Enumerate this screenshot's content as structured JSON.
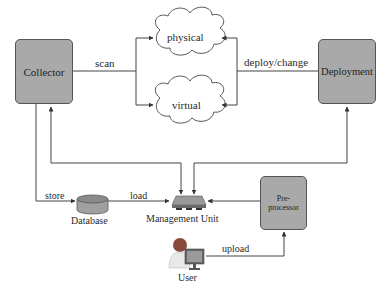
{
  "diagram": {
    "nodes": {
      "collector": {
        "label": "Collector"
      },
      "deployment": {
        "label": "Deployment"
      },
      "physical": {
        "label": "physical"
      },
      "virtual": {
        "label": "virtual"
      },
      "database": {
        "label": "Database"
      },
      "management_unit": {
        "label": "Management Unit"
      },
      "preprocessor": {
        "label_line1": "Pre-",
        "label_line2": "processor"
      },
      "user": {
        "label": "User"
      }
    },
    "edges": {
      "scan": "scan",
      "deploy_change": "deploy/change",
      "store": "store",
      "load": "load",
      "upload": "upload"
    },
    "colors": {
      "box_fill": "#a9a9a9",
      "line": "#444444",
      "cloud_fill": "#ffffff"
    }
  }
}
